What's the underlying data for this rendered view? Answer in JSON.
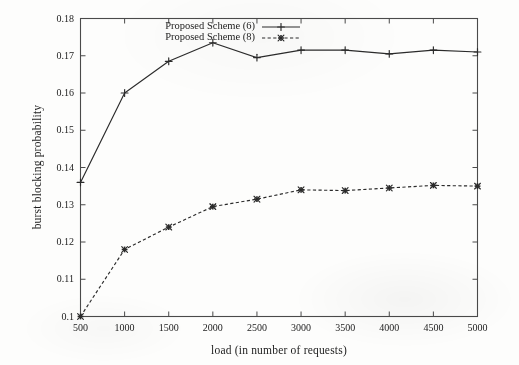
{
  "chart_data": {
    "type": "line",
    "title": "",
    "xlabel": "load (in number of requests)",
    "ylabel": "burst blocking probability",
    "x": [
      500,
      1000,
      1500,
      2000,
      2500,
      3000,
      3500,
      4000,
      4500,
      5000
    ],
    "xticklabels": [
      "500",
      "1000",
      "1500",
      "2000",
      "2500",
      "3000",
      "3500",
      "4000",
      "4500",
      "5000"
    ],
    "yticklabels": [
      "0.1",
      "0.11",
      "0.12",
      "0.13",
      "0.14",
      "0.15",
      "0.16",
      "0.17",
      "0.18"
    ],
    "yticks": [
      0.1,
      0.11,
      0.12,
      0.13,
      0.14,
      0.15,
      0.16,
      0.17,
      0.18
    ],
    "xlim": [
      500,
      5000
    ],
    "ylim": [
      0.1,
      0.18
    ],
    "grid": false,
    "legend_position": "top-center-inside",
    "series": [
      {
        "name": "Proposed Scheme (6)",
        "linestyle": "solid",
        "marker": "plus",
        "color": "#2b2b2b",
        "values": [
          0.136,
          0.16,
          0.1685,
          0.1735,
          0.1695,
          0.1715,
          0.1715,
          0.1705,
          0.1715,
          0.171
        ]
      },
      {
        "name": "Proposed Scheme (8)",
        "linestyle": "dashed",
        "marker": "cross",
        "color": "#2b2b2b",
        "values": [
          0.1,
          0.118,
          0.124,
          0.1295,
          0.1315,
          0.134,
          0.1338,
          0.1345,
          0.1352,
          0.135
        ]
      }
    ]
  }
}
